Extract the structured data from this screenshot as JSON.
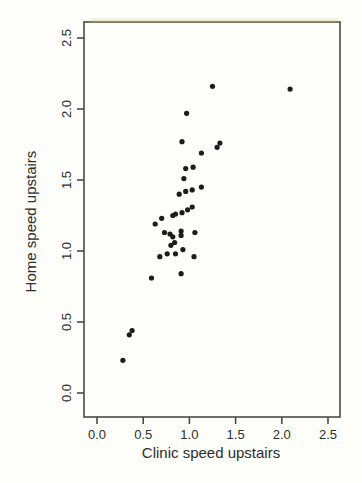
{
  "chart_data": {
    "type": "scatter",
    "title": "",
    "xlabel": "Clinic speed upstairs",
    "ylabel": "Home speed upstairs",
    "xlim": [
      -0.1407,
      2.6299
    ],
    "ylim": [
      -0.169,
      2.6127
    ],
    "x_ticks": [
      0.0,
      0.5,
      1.0,
      1.5,
      2.0,
      2.5
    ],
    "y_ticks": [
      0.0,
      0.5,
      1.0,
      1.5,
      2.0,
      2.5
    ],
    "x_tick_labels": [
      "0.0",
      "0.5",
      "1.0",
      "1.5",
      "2.0",
      "2.5"
    ],
    "y_tick_labels": [
      "0.0",
      "0.5",
      "1.0",
      "1.5",
      "2.0",
      "2.5"
    ],
    "grid": false,
    "legend_position": "none",
    "marker": {
      "shape": "circle",
      "radius": 2.6,
      "color": "#1c1c1c"
    },
    "points": [
      [
        0.28,
        0.23
      ],
      [
        0.35,
        0.41
      ],
      [
        0.38,
        0.44
      ],
      [
        0.59,
        0.81
      ],
      [
        0.91,
        0.84
      ],
      [
        0.68,
        0.96
      ],
      [
        0.76,
        0.98
      ],
      [
        0.85,
        0.98
      ],
      [
        1.05,
        0.96
      ],
      [
        0.93,
        1.01
      ],
      [
        0.8,
        1.04
      ],
      [
        0.84,
        1.06
      ],
      [
        0.82,
        1.1
      ],
      [
        0.79,
        1.12
      ],
      [
        0.73,
        1.13
      ],
      [
        0.91,
        1.11
      ],
      [
        0.91,
        1.14
      ],
      [
        1.06,
        1.13
      ],
      [
        0.63,
        1.19
      ],
      [
        0.7,
        1.23
      ],
      [
        0.82,
        1.25
      ],
      [
        0.85,
        1.26
      ],
      [
        0.92,
        1.27
      ],
      [
        0.98,
        1.29
      ],
      [
        1.03,
        1.31
      ],
      [
        0.89,
        1.4
      ],
      [
        0.96,
        1.42
      ],
      [
        1.03,
        1.43
      ],
      [
        1.13,
        1.45
      ],
      [
        0.94,
        1.51
      ],
      [
        0.96,
        1.58
      ],
      [
        1.04,
        1.59
      ],
      [
        1.13,
        1.69
      ],
      [
        1.3,
        1.73
      ],
      [
        1.33,
        1.76
      ],
      [
        0.92,
        1.77
      ],
      [
        0.97,
        1.97
      ],
      [
        1.25,
        2.16
      ],
      [
        2.09,
        2.14
      ]
    ]
  },
  "style": {
    "background_color": "#fdfdf9",
    "box_color": "#4a4a4a",
    "text_color": "#2e2e2e",
    "point_color": "#1c1c1c"
  },
  "layout_px": {
    "width": 362,
    "height": 483,
    "plot_left": 84,
    "plot_top": 22,
    "plot_right": 340,
    "plot_bottom": 417,
    "tick_length": 7
  }
}
